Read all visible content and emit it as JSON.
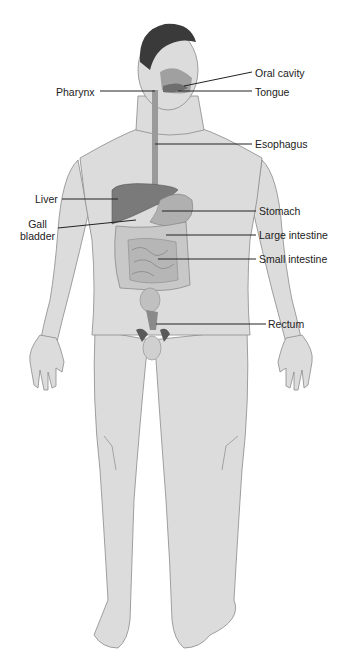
{
  "diagram": {
    "colors": {
      "skin": "#dcdcdc",
      "skin_outline": "#8a8a8a",
      "hair": "#3a3a3a",
      "organ_dark": "#7a7a7a",
      "organ_mid": "#b0b0b0",
      "intestine": "#c8c8c8",
      "leader_line": "#222222",
      "text": "#222222"
    },
    "labels": [
      {
        "id": "oral-cavity",
        "text": "Oral cavity",
        "side": "right",
        "x": 255,
        "y": 67
      },
      {
        "id": "tongue",
        "text": "Tongue",
        "side": "right",
        "x": 255,
        "y": 86
      },
      {
        "id": "pharynx",
        "text": "Pharynx",
        "side": "left",
        "x": 56,
        "y": 86
      },
      {
        "id": "esophagus",
        "text": "Esophagus",
        "side": "right",
        "x": 255,
        "y": 138
      },
      {
        "id": "liver",
        "text": "Liver",
        "side": "left",
        "x": 35,
        "y": 193
      },
      {
        "id": "gall-bladder",
        "text": "Gall\nbladder",
        "side": "left",
        "x": 20,
        "y": 218
      },
      {
        "id": "stomach",
        "text": "Stomach",
        "side": "right",
        "x": 259,
        "y": 205
      },
      {
        "id": "large-intestine",
        "text": "Large intestine",
        "side": "right",
        "x": 259,
        "y": 229
      },
      {
        "id": "small-intestine",
        "text": "Small intestine",
        "side": "right",
        "x": 259,
        "y": 253
      },
      {
        "id": "rectum",
        "text": "Rectum",
        "side": "right",
        "x": 268,
        "y": 318
      }
    ]
  }
}
